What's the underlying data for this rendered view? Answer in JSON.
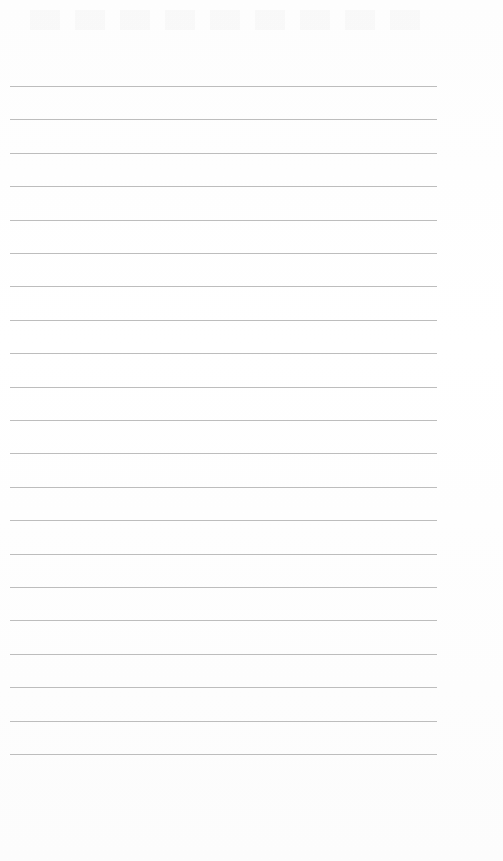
{
  "page": {
    "type": "lined-paper",
    "background_color": "#fefefe",
    "line_color": "#bdbdbd",
    "line_count": 21,
    "first_line_y": 86,
    "line_spacing": 33.4,
    "line_left": 10,
    "line_width": 427,
    "lines": [
      "",
      "",
      "",
      "",
      "",
      "",
      "",
      "",
      "",
      "",
      "",
      "",
      "",
      "",
      "",
      "",
      "",
      "",
      "",
      "",
      ""
    ]
  }
}
